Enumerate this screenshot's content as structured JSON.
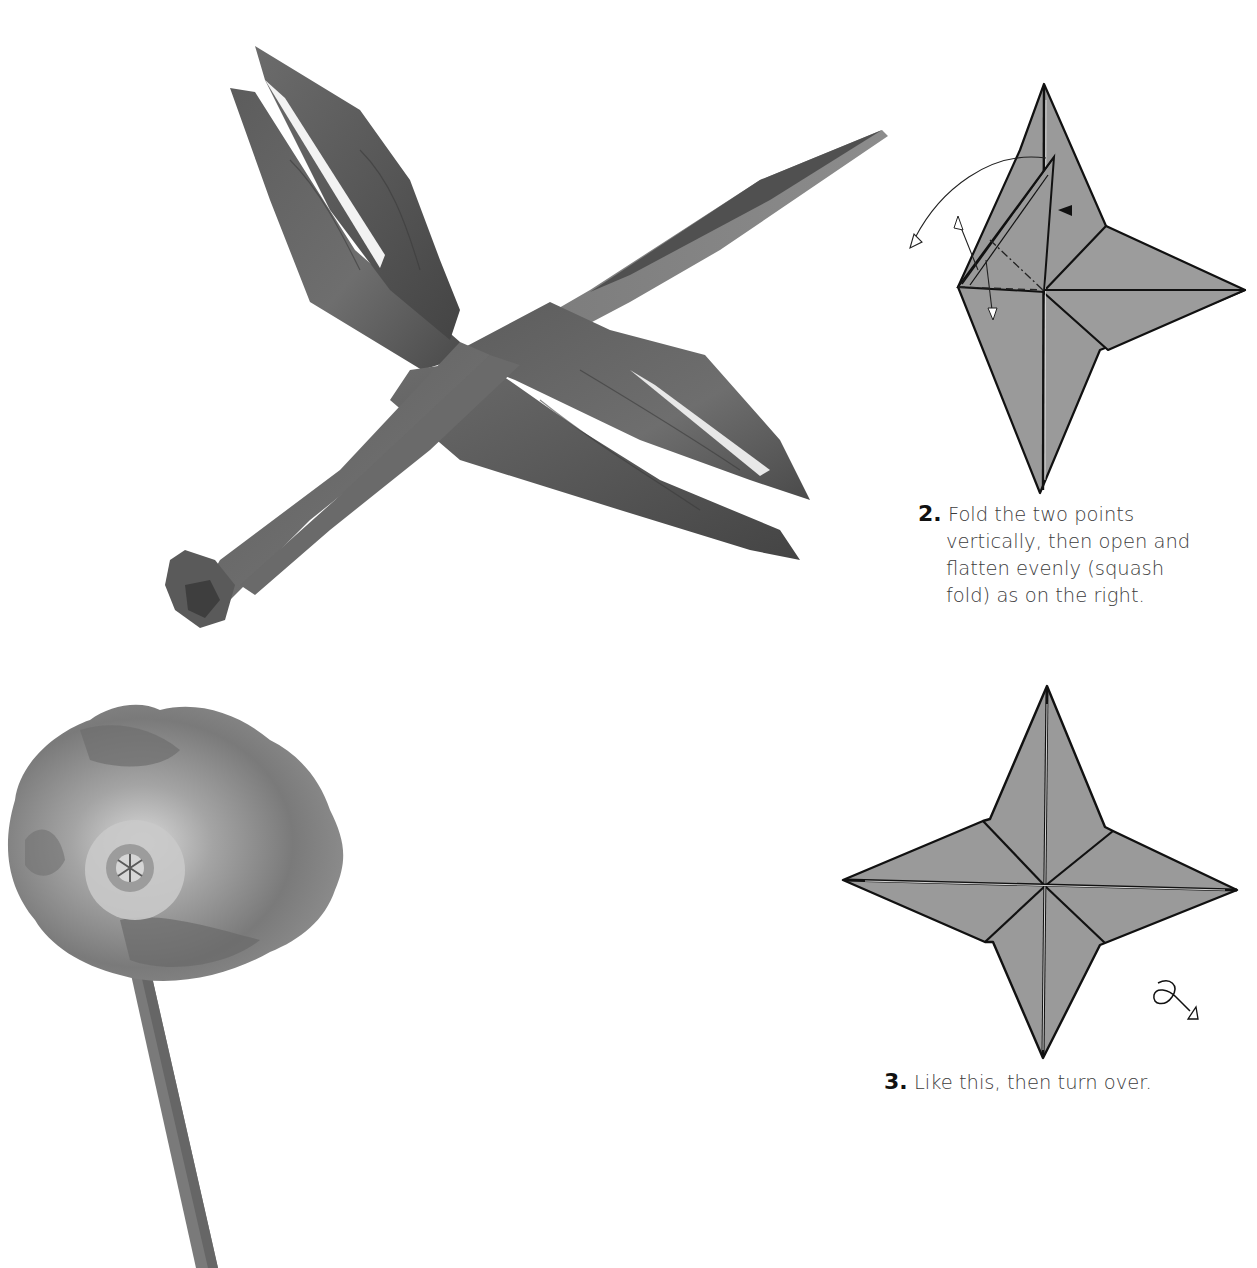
{
  "page": {
    "background": "#ffffff",
    "folio": " "
  },
  "photos": {
    "dragonfly": {
      "subject": "origami dragonfly",
      "paper_color": "#5a5a5a"
    },
    "poppy": {
      "subject": "poppy flower on stem",
      "petal_color": "#8a8a8a"
    }
  },
  "steps": [
    {
      "number": "2.",
      "text_lines": [
        "Fold the two points",
        "vertically, then open and",
        "flatten evenly (squash",
        "fold) as on the right."
      ],
      "diagram": "squash-fold-diagram",
      "fill": "#9a9a9a"
    },
    {
      "number": "3.",
      "text_lines": [
        "Like this, then turn over."
      ],
      "diagram": "four-point-star-diagram",
      "fill": "#9a9a9a",
      "symbol": "turn-over-icon"
    }
  ]
}
